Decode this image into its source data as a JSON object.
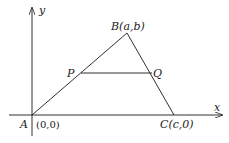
{
  "diagram": {
    "type": "coordinate-geometry-triangle",
    "axes": {
      "x_label": "x",
      "y_label": "y"
    },
    "points": {
      "A": {
        "label": "A",
        "coord_label": "(0,0)"
      },
      "B": {
        "label": "B(a,b)"
      },
      "C": {
        "label": "C(c,0)"
      },
      "P": {
        "label": "P"
      },
      "Q": {
        "label": "Q"
      }
    },
    "segments": [
      "AB",
      "BC",
      "AC",
      "PQ"
    ],
    "colors": {
      "stroke": "#1a1a1a",
      "background": "#ffffff"
    }
  }
}
